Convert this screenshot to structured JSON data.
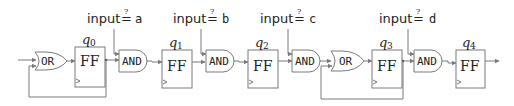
{
  "diagram": {
    "type": "sequential-logic-circuit",
    "gates": {
      "or": "OR",
      "and": "AND",
      "flipflop": "FF"
    },
    "flipflops": [
      {
        "id": "q0",
        "var": "q",
        "sub": "0",
        "label": "FF"
      },
      {
        "id": "q1",
        "var": "q",
        "sub": "1",
        "label": "FF"
      },
      {
        "id": "q2",
        "var": "q",
        "sub": "2",
        "label": "FF"
      },
      {
        "id": "q3",
        "var": "q",
        "sub": "3",
        "label": "FF"
      },
      {
        "id": "q4",
        "var": "q",
        "sub": "4",
        "label": "FF"
      }
    ],
    "and_gates": [
      {
        "id": "and-a",
        "label": "AND",
        "input": {
          "text": "input",
          "op": "=",
          "qmark": "?",
          "var": "a"
        }
      },
      {
        "id": "and-b",
        "label": "AND",
        "input": {
          "text": "input",
          "op": "=",
          "qmark": "?",
          "var": "b"
        }
      },
      {
        "id": "and-c",
        "label": "AND",
        "input": {
          "text": "input",
          "op": "=",
          "qmark": "?",
          "var": "c"
        }
      },
      {
        "id": "and-d",
        "label": "AND",
        "input": {
          "text": "input",
          "op": "=",
          "qmark": "?",
          "var": "d"
        }
      }
    ],
    "or_gates": [
      {
        "id": "or-0",
        "label": "OR",
        "feedback_from": "q0"
      },
      {
        "id": "or-3",
        "label": "OR",
        "feedback_from": "q3"
      }
    ],
    "colors": {
      "wire": "#7a7a7a",
      "text": "#222222",
      "background": "#ffffff"
    }
  }
}
